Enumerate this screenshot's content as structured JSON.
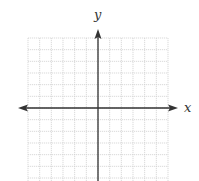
{
  "diagram": {
    "type": "coordinate-plane",
    "x_axis_label": "x",
    "y_axis_label": "y",
    "grid": {
      "columns": 12,
      "rows": 12
    },
    "colors": {
      "axis": "#333333",
      "grid": "#cccccc",
      "background": "#ffffff"
    }
  }
}
